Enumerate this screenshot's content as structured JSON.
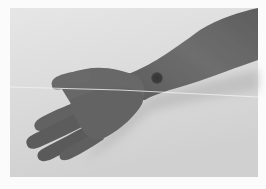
{
  "image": {
    "subject": "photo of an outstretched left hand and forearm, palm down, with a dark circular spot on the wrist",
    "style": "grayscale photograph",
    "colors": {
      "border": "#fbfbfb",
      "background_top": "#e4e4e4",
      "background_bottom": "#d2d2d2",
      "skin_light": "#7e7e7e",
      "skin_dark": "#585858",
      "spot": "#3a3a3a",
      "line": "#f4f4f4",
      "shadow": "#bdbdbd"
    },
    "features": [
      "hand",
      "forearm",
      "wrist-spot",
      "horizontal-line",
      "shadow"
    ]
  }
}
